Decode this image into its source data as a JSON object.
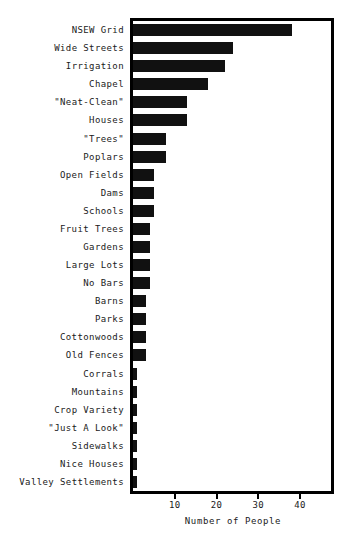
{
  "chart_data": {
    "type": "bar",
    "orientation": "horizontal",
    "title": "",
    "subtitle": "",
    "xlabel": "Number of People",
    "ylabel": "",
    "xlim": [
      0,
      47.4
    ],
    "ylim": [
      0,
      24
    ],
    "grid": false,
    "legend": null,
    "bar_color": "#111111",
    "frame_color": "#000000",
    "background_color": "#ffffff",
    "x_ticks": [
      10,
      20,
      30,
      40
    ],
    "x_tick_labels": [
      "10",
      "20",
      "30",
      "40"
    ],
    "categories": [
      "NSEW Grid",
      "Wide Streets",
      "Irrigation",
      "Chapel",
      "\"Neat-Clean\"",
      "Houses",
      "\"Trees\"",
      "Poplars",
      "Open Fields",
      "Dams",
      "Schools",
      "Fruit Trees",
      "Gardens",
      "Large Lots",
      "No Bars",
      "Barns",
      "Parks",
      "Cottonwoods",
      "Old Fences",
      "Corrals",
      "Mountains",
      "Crop Variety",
      "\"Just A Look\"",
      "Sidewalks",
      "Nice Houses",
      "Valley Settlements"
    ],
    "values": [
      38,
      24,
      22,
      18,
      13,
      13,
      8,
      8,
      5,
      5,
      5,
      4,
      4,
      4,
      4,
      3,
      3,
      3,
      3,
      1,
      1,
      1,
      1,
      1,
      1,
      1
    ]
  }
}
